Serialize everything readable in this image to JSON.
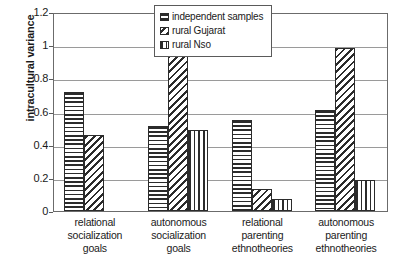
{
  "chart_data": {
    "type": "bar",
    "title": "",
    "subtitle": "",
    "xlabel": "",
    "ylabel": "intracultural variance",
    "ylim": [
      0,
      1.2
    ],
    "yticks": [
      "0",
      "0.2",
      "0.4",
      "0.6",
      "0.8",
      "1",
      "1.2"
    ],
    "ytick_values": [
      0,
      0.2,
      0.4,
      0.6,
      0.8,
      1,
      1.2
    ],
    "grid": true,
    "legend_position": "top-center-right",
    "categories": [
      [
        "relational",
        "socialization",
        "goals"
      ],
      [
        "autonomous",
        "socialization",
        "goals"
      ],
      [
        "relational",
        "parenting",
        "ethnotheories"
      ],
      [
        "autonomous",
        "parenting",
        "ethnotheories"
      ]
    ],
    "category_labels": [
      "relational socialization goals",
      "autonomous socialization goals",
      "relational parenting ethnotheories",
      "autonomous parenting ethnotheories"
    ],
    "series": [
      {
        "name": "independent samples",
        "pattern": "horizontal",
        "values": [
          0.72,
          0.51,
          0.55,
          0.61
        ]
      },
      {
        "name": "rural Gujarat",
        "pattern": "diagonal",
        "values": [
          0.46,
          1.0,
          0.13,
          0.98
        ]
      },
      {
        "name": "rural Nso",
        "pattern": "vertical",
        "values": [
          null,
          0.49,
          0.07,
          0.19
        ]
      }
    ]
  },
  "colors": {
    "ink": "#2b2b2b",
    "axis": "#6b6b6b",
    "grid": "#9a9a9a",
    "background": "#ffffff"
  }
}
